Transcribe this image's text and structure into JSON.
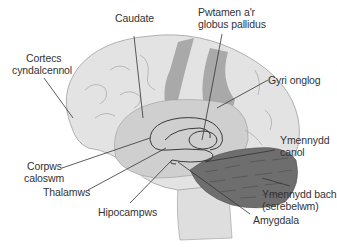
{
  "diagram": {
    "type": "labeled anatomy illustration",
    "colors": {
      "cortex": "#e3e3e3",
      "inner": "#cfcfcf",
      "band": "#a9a9a9",
      "cerebellum": "#6e6e6e",
      "brainstem": "#dedede",
      "outline": "#3a3a3a",
      "line": "#333333"
    },
    "labels": {
      "caudate": "Caudate",
      "putamen_line1": "Pwtamen a'r",
      "putamen_line2": "globus pallidus",
      "cortex_line1": "Cortecs",
      "cortex_line2": "cyndalcennol",
      "angular_gyrus": "Gyri onglog",
      "corpus_line1": "Corpws",
      "corpus_line2": "caloswm",
      "midbrain_line1": "Ymennydd",
      "midbrain_line2": "canol",
      "thalamus": "Thalamws",
      "cerebellum_line1": "Ymennydd bach",
      "cerebellum_line2": "(serebelwm)",
      "hippocampus": "Hipocampws",
      "amygdala": "Amygdala"
    }
  }
}
